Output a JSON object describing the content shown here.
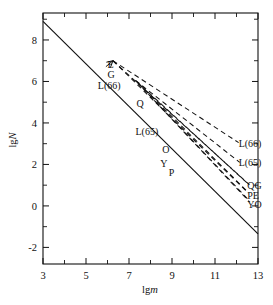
{
  "chart_data": {
    "type": "line",
    "title": "",
    "xlabel": "lgm",
    "ylabel": "lgN",
    "xlim": [
      3,
      13
    ],
    "ylim": [
      -2.8,
      9.3
    ],
    "grid": false,
    "legend_position": "inline-labels",
    "xticks": [
      3,
      5,
      7,
      9,
      11,
      13
    ],
    "xtick_labels": [
      "3",
      "5",
      "7",
      "9",
      "11",
      "13"
    ],
    "xminor_ticks": [
      4,
      6,
      8,
      10,
      12
    ],
    "yticks": [
      8,
      6,
      4,
      2,
      0,
      -2
    ],
    "ytick_labels": [
      "8",
      "6",
      "4",
      "2",
      "0",
      "-2"
    ],
    "yminor_ticks": [
      9,
      7,
      5,
      3,
      1,
      -1
    ],
    "series": [
      {
        "name": "reference",
        "style": "solid",
        "left_label": "",
        "right_label": "",
        "points": [
          [
            3,
            8.9
          ],
          [
            13,
            -1.35
          ]
        ]
      },
      {
        "name": "E",
        "style": "dashed",
        "left_label": "E",
        "right_label": "PE",
        "points": [
          [
            6.25,
            7.0
          ],
          [
            12.55,
            0.62
          ]
        ]
      },
      {
        "name": "G",
        "style": "dashed",
        "left_label": "G",
        "right_label": "QG",
        "points": [
          [
            6.25,
            7.0
          ],
          [
            12.6,
            1.02
          ]
        ]
      },
      {
        "name": "L66",
        "style": "dashed",
        "left_label": "L(66)",
        "right_label": "L(66)",
        "points": [
          [
            6.25,
            7.0
          ],
          [
            12.1,
            3.05
          ]
        ]
      },
      {
        "name": "Q",
        "style": "dashed",
        "left_label": "Q",
        "right_label": "QG",
        "points": [
          [
            7.3,
            6.05
          ],
          [
            12.5,
            1.1
          ]
        ]
      },
      {
        "name": "L65",
        "style": "dashed",
        "left_label": "L(65)",
        "right_label": "L(65)",
        "points": [
          [
            7.3,
            6.05
          ],
          [
            12.15,
            2.1
          ]
        ]
      },
      {
        "name": "O",
        "style": "dashed",
        "left_label": "O",
        "right_label": "YO",
        "points": [
          [
            7.35,
            6.0
          ],
          [
            12.6,
            0.2
          ]
        ]
      },
      {
        "name": "Y",
        "style": "dashed",
        "left_label": "Y",
        "right_label": "YO",
        "points": [
          [
            7.4,
            5.95
          ],
          [
            12.55,
            0.3
          ]
        ]
      },
      {
        "name": "P",
        "style": "dashed",
        "left_label": "P",
        "right_label": "PE",
        "points": [
          [
            7.45,
            5.9
          ],
          [
            12.5,
            0.7
          ]
        ]
      }
    ],
    "left_annotations": [
      {
        "text": "E",
        "x": 6.0,
        "y": 6.85
      },
      {
        "text": "G",
        "x": 6.0,
        "y": 6.35
      },
      {
        "text": "L(66)",
        "x": 5.55,
        "y": 5.85
      },
      {
        "text": "Q",
        "x": 7.35,
        "y": 4.95
      },
      {
        "text": "L(65)",
        "x": 7.3,
        "y": 3.6
      },
      {
        "text": "O",
        "x": 8.55,
        "y": 2.75
      },
      {
        "text": "Y",
        "x": 8.45,
        "y": 2.05
      },
      {
        "text": "P",
        "x": 8.85,
        "y": 1.65
      }
    ],
    "right_annotations": [
      {
        "text": "L(66)",
        "x": 12.1,
        "y": 3.05
      },
      {
        "text": "L(65)",
        "x": 12.1,
        "y": 2.1
      },
      {
        "text": "QG",
        "x": 12.5,
        "y": 1.02
      },
      {
        "text": "PE",
        "x": 12.5,
        "y": 0.55
      },
      {
        "text": "YO",
        "x": 12.5,
        "y": 0.1
      }
    ],
    "colors": {
      "line": "#111111",
      "background": "#ffffff"
    }
  }
}
